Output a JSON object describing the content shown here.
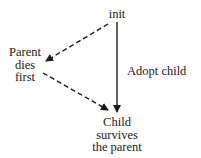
{
  "diagram": {
    "nodes": {
      "init": {
        "label": "init"
      },
      "parent_dies": {
        "lines": [
          "Parent",
          "dies",
          "first"
        ]
      },
      "child": {
        "lines": [
          "Child",
          "survives",
          "the parent"
        ]
      }
    },
    "edges": [
      {
        "from": "init",
        "to": "parent_dies",
        "style": "dashed",
        "label": ""
      },
      {
        "from": "parent_dies",
        "to": "child",
        "style": "dashed",
        "label": ""
      },
      {
        "from": "init",
        "to": "child",
        "style": "solid",
        "label": "Adopt child"
      }
    ],
    "edge_label_adopt": "Adopt child"
  }
}
